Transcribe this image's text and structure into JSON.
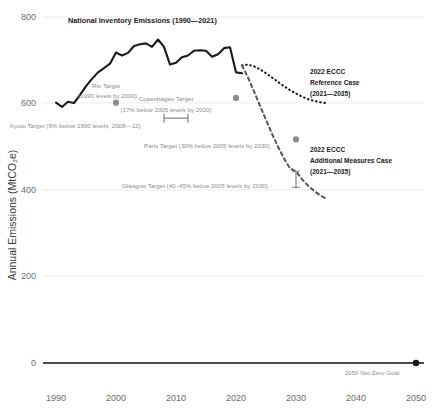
{
  "chart_data": {
    "type": "line",
    "title": "",
    "xlabel": "",
    "ylabel": "Annual Emissions (MtCO₂e)",
    "xlim": [
      1988,
      2053
    ],
    "ylim": [
      0,
      800
    ],
    "grid": true,
    "legend_position": "inline-annotations",
    "xticks": [
      "1990",
      "2000",
      "2010",
      "2020",
      "2030",
      "2040",
      "2050"
    ],
    "xtick_values": [
      1990,
      2000,
      2010,
      2020,
      2030,
      2040,
      2050
    ],
    "yticks": [
      "0",
      "200",
      "400",
      "600",
      "800"
    ],
    "ytick_values": [
      0,
      200,
      400,
      600,
      800
    ],
    "series": [
      {
        "name": "National Inventory Emissions (1990—2021)",
        "style": "solid",
        "color": "#1a1a1a",
        "x": [
          1990,
          1991,
          1992,
          1993,
          1994,
          1995,
          1996,
          1997,
          1998,
          1999,
          2000,
          2001,
          2002,
          2003,
          2004,
          2005,
          2006,
          2007,
          2008,
          2009,
          2010,
          2011,
          2012,
          2013,
          2014,
          2015,
          2016,
          2017,
          2018,
          2019,
          2020,
          2021
        ],
        "values": [
          602,
          592,
          604,
          601,
          620,
          640,
          657,
          672,
          682,
          692,
          718,
          711,
          717,
          733,
          737,
          739,
          731,
          748,
          731,
          690,
          694,
          707,
          711,
          722,
          723,
          722,
          708,
          714,
          728,
          730,
          672,
          670
        ]
      },
      {
        "name": "2022 ECCC Reference Case (2021—2035)",
        "style": "dotted",
        "color": "#1a1a1a",
        "x": [
          2021,
          2022,
          2023,
          2024,
          2025,
          2026,
          2027,
          2028,
          2029,
          2030,
          2031,
          2032,
          2033,
          2034,
          2035
        ],
        "values": [
          688,
          690,
          686,
          679,
          670,
          660,
          650,
          640,
          631,
          623,
          616,
          610,
          606,
          603,
          601
        ]
      },
      {
        "name": "2022 ECCC Additional Measures Case (2021—2035)",
        "style": "dashed",
        "color": "#555555",
        "x": [
          2021,
          2022,
          2023,
          2024,
          2025,
          2026,
          2027,
          2028,
          2029,
          2030,
          2031,
          2032,
          2033,
          2034,
          2035
        ],
        "values": [
          688,
          660,
          628,
          595,
          562,
          530,
          500,
          473,
          450,
          443,
          425,
          410,
          398,
          388,
          380
        ]
      }
    ],
    "annotations": [
      {
        "id": "rio-target",
        "label_line1": "Rio Target",
        "label_line2": "(1990 levels by 2000)",
        "marker_x": 2000,
        "marker_y": 602,
        "marker": "dot"
      },
      {
        "id": "kyoto-target",
        "label_line1": "Kyoto Target (6% below 1990 levels, 2008—12)",
        "marker_x_start": 2008,
        "marker_x_end": 2012,
        "marker_y": 566,
        "marker": "range-bar"
      },
      {
        "id": "copenhagen-target",
        "label_line1": "Copenhagen Target",
        "label_line2": "(17% below 2005 levels by 2020)",
        "marker_x": 2020,
        "marker_y": 613,
        "marker": "dot"
      },
      {
        "id": "paris-target",
        "label_line1": "Paris Target (30% below 2005 levels by 2030)",
        "marker_x": 2030,
        "marker_y": 517,
        "marker": "dot"
      },
      {
        "id": "glasgow-target",
        "label_line1": "Glasgow Target (40–45% below 2005 levels by 2030)",
        "marker_x": 2030,
        "marker_y_low": 406,
        "marker_y_high": 443,
        "marker": "error-bar"
      },
      {
        "id": "reference-case",
        "label_line1": "2022 ECCC",
        "label_line2": "Reference Case",
        "label_line3": "(2021—2035)"
      },
      {
        "id": "additional-measures-case",
        "label_line1": "2022 ECCC",
        "label_line2": "Additional Measures Case",
        "label_line3": "(2021—2035)"
      },
      {
        "id": "net-zero-goal",
        "label_line1": "2050 Net-Zero Goal",
        "marker_x": 2050,
        "marker_y": 0,
        "marker": "dot"
      }
    ],
    "colors": {
      "inventory": "#1a1a1a",
      "reference": "#1a1a1a",
      "additional": "#555555",
      "annotation_grey": "#8c8c8c",
      "grid": "#e6e6e6"
    }
  }
}
